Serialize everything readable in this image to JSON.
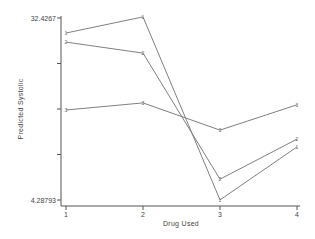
{
  "chart_data": {
    "type": "line",
    "title": "",
    "xlabel": "Drug Used",
    "ylabel": "Predicted Systolic",
    "categories": [
      "1",
      "2",
      "3",
      "4"
    ],
    "x": [
      1,
      2,
      3,
      4
    ],
    "ylim": [
      4.28793,
      32.4267
    ],
    "yticks_labeled": [
      "32.4267",
      "4.28793"
    ],
    "yticks": [
      32.4267,
      25.39,
      18.357,
      11.322,
      4.28793
    ],
    "grid": false,
    "legend": null,
    "series": [
      {
        "name": "Series 1",
        "marker": "1",
        "values": [
          30.1,
          32.6,
          4.3,
          12.5
        ]
      },
      {
        "name": "Series 2",
        "marker": "2",
        "values": [
          28.7,
          27.0,
          7.5,
          13.7
        ]
      },
      {
        "name": "Series 3",
        "marker": "3",
        "values": [
          18.2,
          19.3,
          15.1,
          19.0
        ]
      }
    ],
    "line_color": "#808080"
  }
}
